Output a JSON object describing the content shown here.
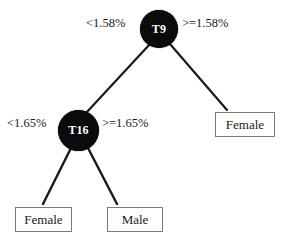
{
  "diagram": {
    "type": "decision-tree",
    "background_color": "#ffffff",
    "node_color": "#0b0b0b",
    "node_text_color": "#ffffff",
    "edge_color": "#1a1a1a",
    "leaf_border_color": "#7a7a7a",
    "leaf_text_color": "#1a1a1a"
  },
  "nodes": {
    "root": {
      "id": "T9",
      "label": "T9",
      "shape": "circle"
    },
    "internal_left": {
      "id": "T16",
      "label": "T16",
      "shape": "circle"
    }
  },
  "leaves": [
    {
      "id": "leaf-female-right",
      "label": "Female",
      "shape": "rectangle"
    },
    {
      "id": "leaf-female-left",
      "label": "Female",
      "shape": "rectangle"
    },
    {
      "id": "leaf-male",
      "label": "Male",
      "shape": "rectangle"
    }
  ],
  "edges": [
    {
      "from": "T9",
      "to": "T16",
      "label": "<1.58%",
      "side": "left"
    },
    {
      "from": "T9",
      "to": "leaf-female-right",
      "label": ">=1.58%",
      "side": "right"
    },
    {
      "from": "T16",
      "to": "leaf-female-left",
      "label": "<1.65%",
      "side": "left"
    },
    {
      "from": "T16",
      "to": "leaf-male",
      "label": ">=1.65%",
      "side": "right"
    }
  ],
  "labels": {
    "t9_left": "<1.58%",
    "t9_right": ">=1.58%",
    "t16_left": "<1.65%",
    "t16_right": ">=1.65%"
  }
}
